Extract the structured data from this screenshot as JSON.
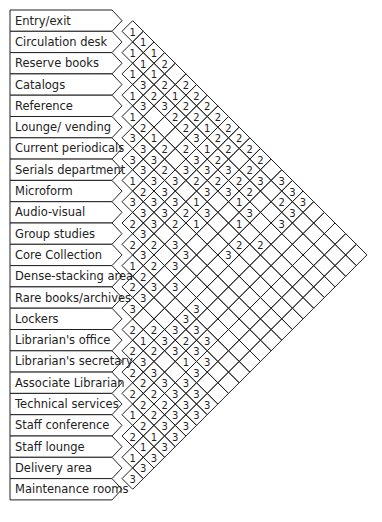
{
  "legend": {
    "1": "essential / very close",
    "2": "important / close",
    "3": "desirable / nearby",
    "blank": "no relationship"
  },
  "spaces": [
    "Entry/exit",
    "Circulation desk",
    "Reserve books",
    "Catalogs",
    "Reference",
    "Lounge/ vending",
    "Current periodicals",
    "Serials department",
    "Microform",
    "Audio-visual",
    "Group studies",
    "Core Collection",
    "Dense-stacking area",
    "Rare books/archives",
    "Lockers",
    "Librarian's office",
    "Librarian's secretary",
    "Associate Librarian",
    "Technical services",
    "Staff conference",
    "Staff lounge",
    "Delivery area",
    "Maintenance rooms"
  ],
  "relationships": [
    {
      "a": 0,
      "b": 1,
      "v": "1"
    },
    {
      "a": 1,
      "b": 2,
      "v": "1"
    },
    {
      "a": 0,
      "b": 2,
      "v": "1"
    },
    {
      "a": 2,
      "b": 3,
      "v": "1"
    },
    {
      "a": 1,
      "b": 3,
      "v": "1"
    },
    {
      "a": 0,
      "b": 3,
      "v": "1"
    },
    {
      "a": 3,
      "b": 4,
      "v": "1"
    },
    {
      "a": 2,
      "b": 4,
      "v": "3"
    },
    {
      "a": 1,
      "b": 4,
      "v": "1"
    },
    {
      "a": 0,
      "b": 4,
      "v": "2"
    },
    {
      "a": 4,
      "b": 5,
      "v": "1"
    },
    {
      "a": 3,
      "b": 5,
      "v": "3"
    },
    {
      "a": 2,
      "b": 5,
      "v": "2"
    },
    {
      "a": 1,
      "b": 5,
      "v": "2"
    },
    {
      "a": 2,
      "b": 6,
      "v": "3"
    },
    {
      "a": 1,
      "b": 6,
      "v": "1"
    },
    {
      "a": 0,
      "b": 6,
      "v": "2"
    },
    {
      "a": 5,
      "b": 6,
      "v": "3"
    },
    {
      "a": 4,
      "b": 6,
      "v": "2"
    },
    {
      "a": 0,
      "b": 7,
      "v": "2"
    },
    {
      "a": 1,
      "b": 7,
      "v": "2"
    },
    {
      "a": 5,
      "b": 7,
      "v": "3"
    },
    {
      "a": 4,
      "b": 7,
      "v": "1"
    },
    {
      "a": 2,
      "b": 7,
      "v": "2"
    },
    {
      "a": 0,
      "b": 8,
      "v": "2"
    },
    {
      "a": 6,
      "b": 7,
      "v": "3"
    },
    {
      "a": 5,
      "b": 8,
      "v": "3"
    },
    {
      "a": 4,
      "b": 8,
      "v": "2"
    },
    {
      "a": 2,
      "b": 8,
      "v": "2"
    },
    {
      "a": 1,
      "b": 8,
      "v": "2"
    },
    {
      "a": 6,
      "b": 8,
      "v": "3"
    },
    {
      "a": 5,
      "b": 9,
      "v": "2"
    },
    {
      "a": 3,
      "b": 9,
      "v": "2"
    },
    {
      "a": 2,
      "b": 9,
      "v": "3"
    },
    {
      "a": 1,
      "b": 9,
      "v": "1"
    },
    {
      "a": 0,
      "b": 9,
      "v": "2"
    },
    {
      "a": 7,
      "b": 8,
      "v": "1"
    },
    {
      "a": 6,
      "b": 9,
      "v": "3"
    },
    {
      "a": 5,
      "b": 10,
      "v": "3"
    },
    {
      "a": 3,
      "b": 10,
      "v": "3"
    },
    {
      "a": 2,
      "b": 10,
      "v": "1"
    },
    {
      "a": 1,
      "b": 10,
      "v": "2"
    },
    {
      "a": 0,
      "b": 10,
      "v": "2"
    },
    {
      "a": 7,
      "b": 9,
      "v": "2"
    },
    {
      "a": 6,
      "b": 10,
      "v": "3"
    },
    {
      "a": 4,
      "b": 10,
      "v": "3"
    },
    {
      "a": 3,
      "b": 11,
      "v": "3"
    },
    {
      "a": 2,
      "b": 11,
      "v": "2"
    },
    {
      "a": 1,
      "b": 11,
      "v": "2"
    },
    {
      "a": 0,
      "b": 11,
      "v": "2"
    },
    {
      "a": 8,
      "b": 9,
      "v": "3"
    },
    {
      "a": 7,
      "b": 10,
      "v": "3"
    },
    {
      "a": 6,
      "b": 11,
      "v": "3"
    },
    {
      "a": 4,
      "b": 11,
      "v": "2"
    },
    {
      "a": 3,
      "b": 12,
      "v": "2"
    },
    {
      "a": 2,
      "b": 12,
      "v": "3"
    },
    {
      "a": 0,
      "b": 12,
      "v": "2"
    },
    {
      "a": 8,
      "b": 10,
      "v": "3"
    },
    {
      "a": 7,
      "b": 11,
      "v": "3"
    },
    {
      "a": 5,
      "b": 12,
      "v": "1"
    },
    {
      "a": 4,
      "b": 12,
      "v": "3"
    },
    {
      "a": 2,
      "b": 13,
      "v": "2"
    },
    {
      "a": 1,
      "b": 13,
      "v": "2"
    },
    {
      "a": 9,
      "b": 10,
      "v": "2"
    },
    {
      "a": 8,
      "b": 11,
      "v": "3"
    },
    {
      "a": 7,
      "b": 12,
      "v": "2"
    },
    {
      "a": 6,
      "b": 12,
      "v": "2"
    },
    {
      "a": 3,
      "b": 13,
      "v": "3"
    },
    {
      "a": 0,
      "b": 13,
      "v": "2"
    },
    {
      "a": 10,
      "b": 11,
      "v": "2"
    },
    {
      "a": 9,
      "b": 11,
      "v": "3"
    },
    {
      "a": 6,
      "b": 13,
      "v": "1"
    },
    {
      "a": 5,
      "b": 13,
      "v": "3"
    },
    {
      "a": 1,
      "b": 14,
      "v": "3"
    },
    {
      "a": 11,
      "b": 12,
      "v": "1"
    },
    {
      "a": 10,
      "b": 12,
      "v": "3"
    },
    {
      "a": 9,
      "b": 12,
      "v": "2"
    },
    {
      "a": 8,
      "b": 13,
      "v": "3"
    },
    {
      "a": 3,
      "b": 14,
      "v": "1"
    },
    {
      "a": 2,
      "b": 14,
      "v": "2"
    },
    {
      "a": 11,
      "b": 13,
      "v": "2"
    },
    {
      "a": 10,
      "b": 13,
      "v": "2"
    },
    {
      "a": 8,
      "b": 14,
      "v": "3"
    },
    {
      "a": 4,
      "b": 15,
      "v": "1"
    },
    {
      "a": 3,
      "b": 15,
      "v": "3"
    },
    {
      "a": 0,
      "b": 15,
      "v": "3"
    },
    {
      "a": 12,
      "b": 13,
      "v": "2"
    },
    {
      "a": 11,
      "b": 14,
      "v": "3"
    },
    {
      "a": 9,
      "b": 14,
      "v": "3"
    },
    {
      "a": 5,
      "b": 16,
      "v": "2"
    },
    {
      "a": 1,
      "b": 16,
      "v": "2"
    },
    {
      "a": 0,
      "b": 16,
      "v": "3"
    },
    {
      "a": 12,
      "b": 14,
      "v": "3"
    },
    {
      "a": 10,
      "b": 15,
      "v": "3"
    },
    {
      "a": 6,
      "b": 16,
      "v": "3"
    },
    {
      "a": 4,
      "b": 17,
      "v": "2"
    },
    {
      "a": 2,
      "b": 17,
      "v": "3"
    },
    {
      "a": 1,
      "b": 17,
      "v": "3"
    },
    {
      "a": 0,
      "b": 17,
      "v": "3"
    },
    {
      "a": 13,
      "b": 14,
      "v": "3"
    },
    {
      "a": 14,
      "b": 15,
      "v": "2"
    },
    {
      "a": 13,
      "b": 16,
      "v": "2"
    },
    {
      "a": 12,
      "b": 17,
      "v": "3"
    },
    {
      "a": 11,
      "b": 17,
      "v": "3"
    },
    {
      "a": 10,
      "b": 17,
      "v": "3"
    },
    {
      "a": 15,
      "b": 16,
      "v": "2"
    },
    {
      "a": 14,
      "b": 16,
      "v": "1"
    },
    {
      "a": 13,
      "b": 17,
      "v": "3"
    },
    {
      "a": 12,
      "b": 18,
      "v": "2"
    },
    {
      "a": 11,
      "b": 18,
      "v": "3"
    },
    {
      "a": 15,
      "b": 17,
      "v": "3"
    },
    {
      "a": 14,
      "b": 17,
      "v": "2"
    },
    {
      "a": 13,
      "b": 18,
      "v": "3"
    },
    {
      "a": 12,
      "b": 19,
      "v": "3"
    },
    {
      "a": 11,
      "b": 19,
      "v": "3"
    },
    {
      "a": 16,
      "b": 17,
      "v": "2"
    },
    {
      "a": 15,
      "b": 18,
      "v": "3"
    },
    {
      "a": 13,
      "b": 19,
      "v": "1"
    },
    {
      "a": 12,
      "b": 20,
      "v": "3"
    },
    {
      "a": 16,
      "b": 18,
      "v": "2"
    },
    {
      "a": 15,
      "b": 19,
      "v": "3"
    },
    {
      "a": 14,
      "b": 20,
      "v": "3"
    },
    {
      "a": 13,
      "b": 20,
      "v": "3"
    },
    {
      "a": 17,
      "b": 18,
      "v": "2"
    },
    {
      "a": 16,
      "b": 19,
      "v": "2"
    },
    {
      "a": 15,
      "b": 20,
      "v": "3"
    },
    {
      "a": 14,
      "b": 21,
      "v": "3"
    },
    {
      "a": 16,
      "b": 20,
      "v": "2"
    },
    {
      "a": 17,
      "b": 19,
      "v": "2"
    },
    {
      "a": 15,
      "b": 21,
      "v": "3"
    },
    {
      "a": 14,
      "b": 22,
      "v": "3"
    },
    {
      "a": 18,
      "b": 19,
      "v": "1"
    },
    {
      "a": 17,
      "b": 20,
      "v": "2"
    },
    {
      "a": 16,
      "b": 21,
      "v": "3"
    },
    {
      "a": 15,
      "b": 22,
      "v": "3"
    },
    {
      "a": 18,
      "b": 20,
      "v": "2"
    },
    {
      "a": 17,
      "b": 21,
      "v": "3"
    },
    {
      "a": 16,
      "b": 22,
      "v": "3"
    },
    {
      "a": 19,
      "b": 20,
      "v": "2"
    },
    {
      "a": 18,
      "b": 21,
      "v": "1"
    },
    {
      "a": 17,
      "b": 22,
      "v": "3"
    },
    {
      "a": 19,
      "b": 21,
      "v": "1"
    },
    {
      "a": 18,
      "b": 22,
      "v": "3"
    },
    {
      "a": 20,
      "b": 21,
      "v": "1"
    },
    {
      "a": 19,
      "b": 22,
      "v": "3"
    },
    {
      "a": 20,
      "b": 22,
      "v": "3"
    },
    {
      "a": 21,
      "b": 22,
      "v": "3"
    }
  ],
  "layout": {
    "left": 10,
    "top": 10,
    "row_height": 21.3,
    "label_right": 112,
    "tip_width": 10
  }
}
